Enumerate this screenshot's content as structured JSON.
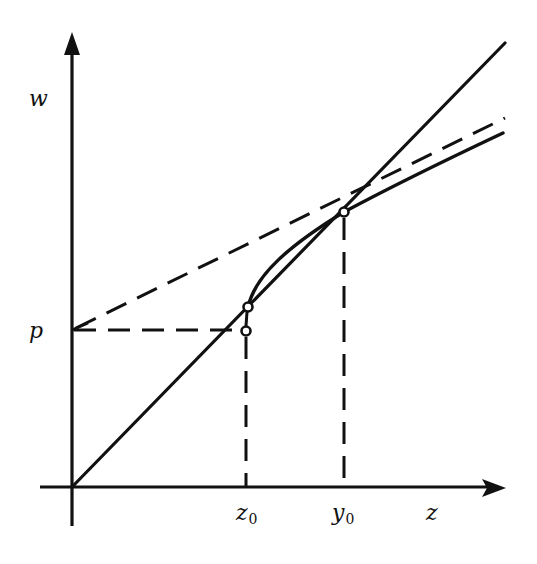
{
  "figure": {
    "type": "function-diagram",
    "colors": {
      "stroke": "#111111",
      "background": "#ffffff"
    },
    "axes": {
      "horizontal_label": "z",
      "vertical_label": "w"
    },
    "labels": {
      "w": "w",
      "p": "p",
      "z0_main": "z",
      "z0_sub": "0",
      "y0_main": "y",
      "y0_sub": "0",
      "z": "z"
    },
    "elements": [
      {
        "name": "diagonal-line",
        "style": "solid",
        "description": "line w = z through the origin"
      },
      {
        "name": "concave-curve",
        "style": "solid",
        "description": "curve starting at z0 above the diagonal, crossing it at y0"
      },
      {
        "name": "tangent-line",
        "style": "dashed",
        "description": "dashed line from (0, p) through the point at y0"
      },
      {
        "name": "p-level-line",
        "style": "dashed",
        "description": "horizontal dashed line at height p up to z0"
      },
      {
        "name": "z0-drop-line",
        "style": "dashed",
        "description": "vertical dashed line from curve to z0"
      },
      {
        "name": "y0-drop-line",
        "style": "dashed",
        "description": "vertical dashed line from intersection to y0"
      }
    ],
    "points": [
      {
        "name": "curve-start-point",
        "at": "z0 on curve"
      },
      {
        "name": "p-level-point",
        "at": "(z0, p)"
      },
      {
        "name": "y0-point",
        "at": "y0 intersection"
      }
    ]
  }
}
